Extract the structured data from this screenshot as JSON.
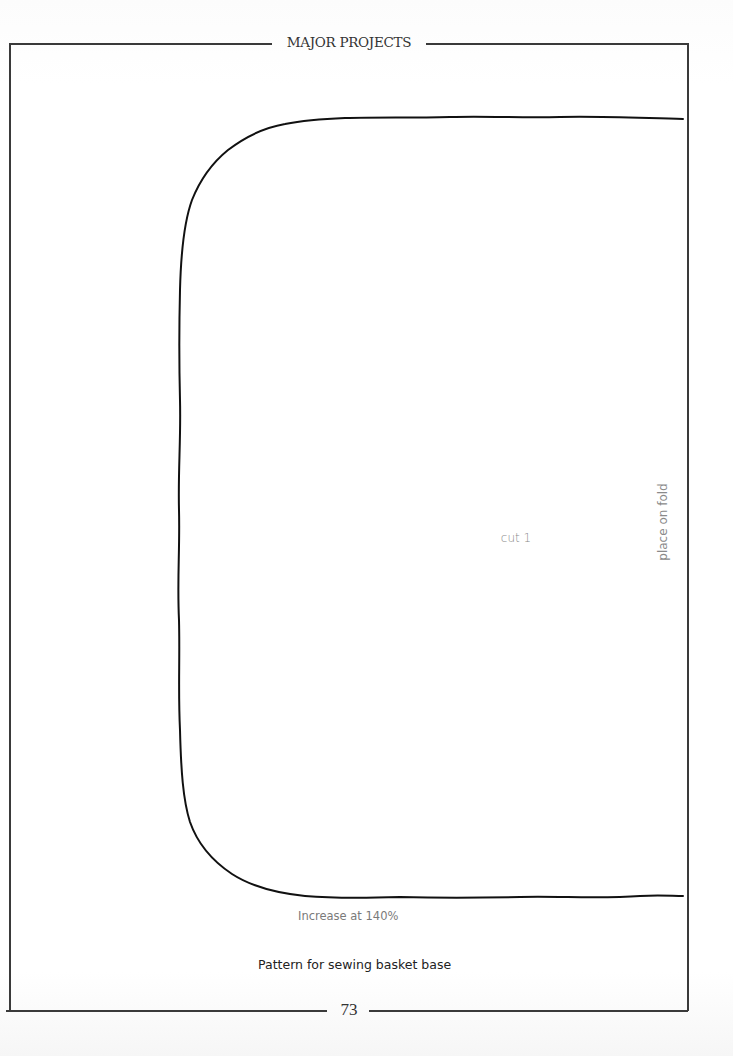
{
  "header": {
    "running_title": "MAJOR PROJECTS"
  },
  "pattern": {
    "name": "sewing basket base",
    "labels": {
      "cut": "cut 1",
      "fold": "place on fold",
      "scale_note": "Increase at 140%"
    }
  },
  "caption": "Pattern for sewing basket base",
  "footer": {
    "page_number": "73"
  },
  "colors": {
    "frame": "#3a3a3a",
    "pattern_line": "#111111",
    "label_text": "#8a8a8a",
    "caption_text": "#222222"
  }
}
